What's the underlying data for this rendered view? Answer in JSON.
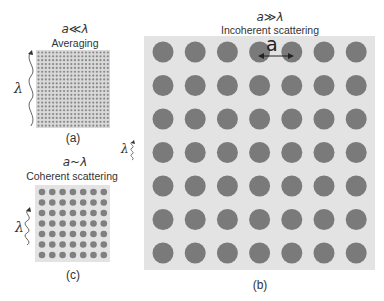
{
  "panels": {
    "a": {
      "condition": "a≪λ",
      "title": "Averaging",
      "caption": "(a)",
      "lambda_label": "λ",
      "grid": {
        "rows": 20,
        "cols": 20
      }
    },
    "b": {
      "condition": "a≫λ",
      "title": "Incoherent scattering",
      "caption": "(b)",
      "lambda_label": "λ",
      "spacing_label": "a",
      "grid": {
        "rows": 7,
        "cols": 7
      }
    },
    "c": {
      "condition": "a~λ",
      "title": "Coherent scattering",
      "caption": "(c)",
      "lambda_label": "λ",
      "grid": {
        "rows": 7,
        "cols": 7
      }
    }
  },
  "colors": {
    "panel_bg": "#e3e3e3",
    "dot": "#7a7a7a",
    "text": "#333333"
  }
}
